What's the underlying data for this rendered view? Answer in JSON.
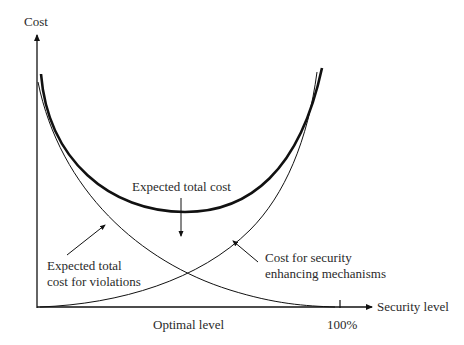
{
  "diagram": {
    "type": "cost-vs-security-level curves",
    "axes": {
      "y_label": "Cost",
      "x_label": "Security level",
      "x_tick_label": "100%",
      "x_marker_label": "Optimal level"
    },
    "curves": [
      {
        "name": "Expected total cost",
        "style": "thick",
        "shape": "U-shaped"
      },
      {
        "name": "Expected total cost for violations",
        "style": "thin",
        "shape": "decreasing"
      },
      {
        "name": "Cost for security enhancing mechanisms",
        "style": "thin",
        "shape": "increasing"
      }
    ],
    "annotations": {
      "total": "Expected total cost",
      "violations_line1": "Expected total",
      "violations_line2": "cost for violations",
      "security_line1": "Cost for security",
      "security_line2": "enhancing mechanisms"
    },
    "colors": {
      "line": "#111111",
      "text": "#2a2a2a",
      "background": "#ffffff"
    }
  }
}
